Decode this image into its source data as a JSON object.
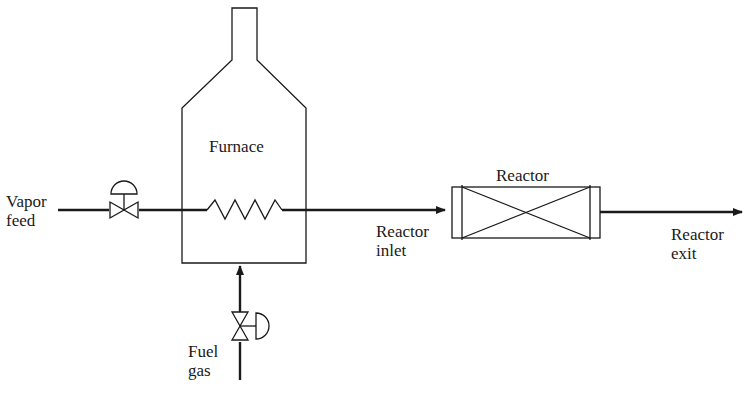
{
  "diagram": {
    "type": "process-flow",
    "colors": {
      "line": "#1a1a1a",
      "background": "#ffffff"
    },
    "labels": {
      "vapor_feed": [
        "Vapor",
        "feed"
      ],
      "furnace": "Furnace",
      "reactor": "Reactor",
      "reactor_inlet": [
        "Reactor",
        "inlet"
      ],
      "reactor_exit": [
        "Reactor",
        "exit"
      ],
      "fuel_gas": [
        "Fuel",
        "gas"
      ]
    },
    "components": [
      {
        "id": "feed-valve",
        "kind": "control-valve",
        "stream": "Vapor feed"
      },
      {
        "id": "furnace",
        "kind": "fired-heater",
        "label": "Furnace"
      },
      {
        "id": "heating-coil",
        "kind": "coil"
      },
      {
        "id": "reactor",
        "kind": "packed-bed-reactor",
        "label": "Reactor"
      },
      {
        "id": "fuel-valve",
        "kind": "control-valve",
        "stream": "Fuel gas"
      }
    ],
    "streams": [
      {
        "from": "Vapor feed",
        "to": "furnace"
      },
      {
        "from": "furnace",
        "to": "reactor",
        "label": "Reactor inlet"
      },
      {
        "from": "reactor",
        "to": "out",
        "label": "Reactor exit"
      },
      {
        "from": "Fuel gas",
        "to": "furnace"
      }
    ]
  }
}
